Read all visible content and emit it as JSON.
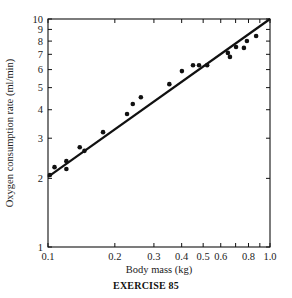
{
  "chart_data": {
    "type": "scatter",
    "title": "",
    "caption": "EXERCISE 85",
    "xlabel": "Body mass (kg)",
    "ylabel": "Oxygen consumption rate (ml/min)",
    "xscale": "log",
    "yscale": "log",
    "xlim": [
      0.1,
      1.0
    ],
    "ylim": [
      1,
      10
    ],
    "grid": false,
    "legend": null,
    "x_ticks": [
      0.1,
      0.2,
      0.3,
      0.4,
      0.5,
      0.6,
      0.7,
      0.8,
      0.9,
      1.0
    ],
    "x_tick_labels": [
      "0.1",
      "0.2",
      "0.3",
      "0.4",
      "0.5",
      "0.6",
      "",
      "0.8",
      "",
      "1.0"
    ],
    "y_ticks": [
      1,
      2,
      3,
      4,
      5,
      6,
      7,
      8,
      9,
      10
    ],
    "y_tick_labels": [
      "1",
      "2",
      "3",
      "4",
      "5",
      "6",
      "7",
      "8",
      "9",
      "10"
    ],
    "series": [
      {
        "name": "observations",
        "kind": "points",
        "x": [
          0.102,
          0.107,
          0.121,
          0.121,
          0.139,
          0.146,
          0.177,
          0.227,
          0.241,
          0.262,
          0.352,
          0.401,
          0.45,
          0.479,
          0.521,
          0.646,
          0.66,
          0.703,
          0.763,
          0.787,
          0.866
        ],
        "y": [
          2.07,
          2.24,
          2.38,
          2.2,
          2.74,
          2.64,
          3.19,
          3.83,
          4.24,
          4.54,
          5.18,
          5.91,
          6.27,
          6.27,
          6.27,
          7.1,
          6.82,
          7.54,
          7.47,
          8.01,
          8.42
        ]
      },
      {
        "name": "fitted line",
        "kind": "line",
        "x": [
          0.1,
          1.0
        ],
        "y": [
          2.03,
          10.0
        ]
      }
    ]
  },
  "colors": {
    "ink": "#111111",
    "background": "#ffffff"
  }
}
